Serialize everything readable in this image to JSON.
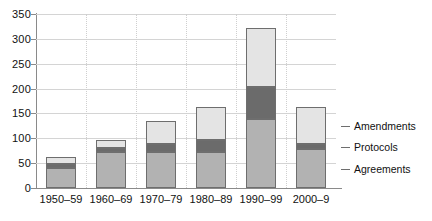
{
  "chart_data": {
    "type": "bar",
    "subtype": "stacked-vertical",
    "title": "",
    "xlabel": "",
    "ylabel": "",
    "ylim": [
      0,
      350
    ],
    "ytick_step": 50,
    "ytick_labels": [
      "0",
      "50",
      "100",
      "150",
      "200",
      "250",
      "300",
      "350"
    ],
    "ytick_values": [
      0,
      50,
      100,
      150,
      200,
      250,
      300,
      350
    ],
    "grid": "horizontal-and-category-dotted",
    "legend_position": "right-inline",
    "categories": [
      "1950–59",
      "1960–69",
      "1970–79",
      "1980–89",
      "1990–99",
      "2000–9"
    ],
    "series": [
      {
        "name": "Agreements",
        "color": "#b2b2b2",
        "values": [
          40,
          72,
          72,
          72,
          138,
          78
        ]
      },
      {
        "name": "Protocols",
        "color": "#6b6b6b",
        "values": [
          8,
          8,
          16,
          25,
          65,
          10
        ]
      },
      {
        "name": "Amendments",
        "color": "#e4e4e4",
        "values": [
          14,
          17,
          46,
          65,
          118,
          74
        ]
      }
    ],
    "totals": [
      62,
      97,
      134,
      162,
      321,
      162
    ]
  },
  "legend": {
    "items": [
      {
        "label": "Amendments",
        "color": "#e4e4e4"
      },
      {
        "label": "Protocols",
        "color": "#6b6b6b"
      },
      {
        "label": "Agreements",
        "color": "#b2b2b2"
      }
    ]
  },
  "colors": {
    "axis": "#8a8a8a",
    "gridline": "#d4d4d4",
    "bar_border": "#6e6e6e",
    "text": "#111111",
    "background": "#ffffff"
  }
}
